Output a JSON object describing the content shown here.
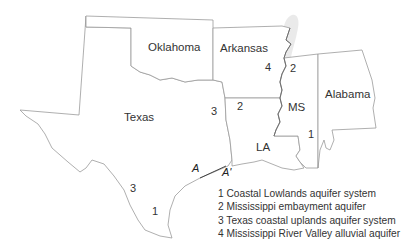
{
  "map": {
    "states": [
      {
        "id": "oklahoma",
        "label": "Oklahoma"
      },
      {
        "id": "arkansas",
        "label": "Arkansas"
      },
      {
        "id": "texas",
        "label": "Texas"
      },
      {
        "id": "louisiana",
        "label": "LA"
      },
      {
        "id": "mississippi",
        "label": "MS"
      },
      {
        "id": "alabama",
        "label": "Alabama"
      }
    ],
    "aquifer_labels": [
      {
        "number": "4",
        "location": "Arkansas - Mississippi River valley"
      },
      {
        "number": "2",
        "location": "Mississippi (north)"
      },
      {
        "number": "2",
        "location": "Northern Louisiana"
      },
      {
        "number": "3",
        "location": "East Texas"
      },
      {
        "number": "1",
        "location": "Southern Mississippi"
      },
      {
        "number": "3",
        "location": "South Texas"
      },
      {
        "number": "1",
        "location": "South Texas coast"
      }
    ],
    "section_line": {
      "start": "A",
      "end": "A'"
    },
    "legend": [
      {
        "number": "1",
        "text": "1 Coastal Lowlands aquifer system"
      },
      {
        "number": "2",
        "text": "2 Mississippi embayment aquifer"
      },
      {
        "number": "3",
        "text": "3  Texas coastal uplands aquifer system"
      },
      {
        "number": "4",
        "text": "4  Mississippi River Valley alluvial aquifer"
      }
    ],
    "colors": {
      "state_border": "#9a9a9a",
      "aquifer_shade": "#e6e6e6",
      "text": "#333333",
      "river": "#6e6e6e"
    }
  }
}
